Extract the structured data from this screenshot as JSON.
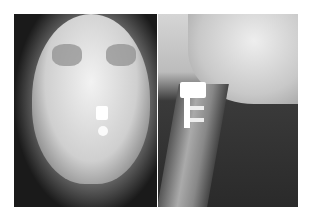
{
  "figure": {
    "panels": [
      {
        "id": "left",
        "view": "AP skull/face radiograph"
      },
      {
        "id": "right",
        "view": "Lateral cervical spine radiograph"
      }
    ]
  }
}
